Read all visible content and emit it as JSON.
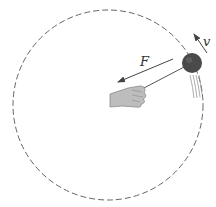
{
  "diagram": {
    "labels": {
      "force": "F",
      "velocity": "v"
    },
    "elements": {
      "path": {
        "type": "dashed-circle",
        "center": [
          108,
          105
        ],
        "radius": 95,
        "color": "#555555"
      },
      "ball": {
        "center": [
          192,
          63
        ],
        "radius": 10,
        "color": "#444444"
      },
      "string": {
        "from": [
          145,
          90
        ],
        "to": [
          185,
          67
        ]
      },
      "force_arrow": {
        "from": [
          173,
          59
        ],
        "to": [
          118,
          82
        ],
        "direction": "toward center"
      },
      "velocity_arrow": {
        "from": [
          207,
          52
        ],
        "to": [
          194,
          34
        ],
        "direction": "tangent"
      },
      "hand": {
        "position": [
          110,
          85
        ],
        "color": "#bbbbbb"
      }
    }
  }
}
